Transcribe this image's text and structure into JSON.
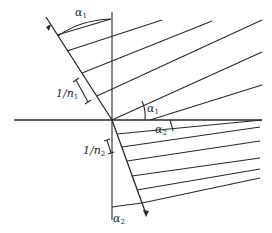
{
  "diagram": {
    "title": "",
    "colors": {
      "stroke": "#2a2a2a",
      "background": "#ffffff"
    },
    "labels": {
      "alpha1_top": {
        "symbol": "α",
        "sub": "1"
      },
      "alpha1_mid": {
        "symbol": "α",
        "sub": "1"
      },
      "alpha2_mid": {
        "symbol": "α",
        "sub": "2"
      },
      "alpha2_bottom": {
        "symbol": "α",
        "sub": "2"
      },
      "spacing1": {
        "text": "1/n",
        "sub": "1"
      },
      "spacing2": {
        "text": "1/n",
        "sub": "2"
      }
    },
    "elements": [
      "vertical axis (normal)",
      "horizontal axis (interface)",
      "incident ray with arrow",
      "refracted ray with arrow",
      "upper wavefront lines (medium 1)",
      "lower wavefront lines (medium 2)"
    ]
  }
}
